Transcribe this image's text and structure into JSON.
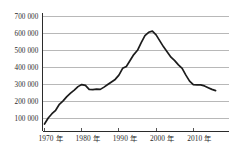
{
  "chart_data": {
    "type": "line",
    "title": "",
    "subtitle": "",
    "xlabel": "",
    "ylabel": "",
    "grid": true,
    "legend": false,
    "legend_position": "none",
    "line_color": "#1c1c1c",
    "grid_color": "#9a9a9a",
    "axis_color": "#2b2b2b",
    "background_color": "#ffffff",
    "xlim": [
      1970,
      2016
    ],
    "ylim": [
      0,
      700000
    ],
    "y_ticks": [
      100000,
      200000,
      300000,
      400000,
      500000,
      600000,
      700000
    ],
    "y_tick_labels": [
      "100 000",
      "200 000",
      "300 000",
      "400 000",
      "500 000",
      "600 000",
      "700 000"
    ],
    "x_ticks": [
      1970,
      1980,
      1990,
      2000,
      2010
    ],
    "x_tick_labels": [
      "1970 年",
      "1980 年",
      "1990 年",
      "2000 年",
      "2010 年"
    ],
    "series": [
      {
        "name": "value",
        "x": [
          1970,
          1971,
          1972,
          1973,
          1974,
          1975,
          1976,
          1977,
          1978,
          1979,
          1980,
          1981,
          1982,
          1983,
          1984,
          1985,
          1986,
          1987,
          1988,
          1989,
          1990,
          1991,
          1992,
          1993,
          1994,
          1995,
          1996,
          1997,
          1998,
          1999,
          2000,
          2001,
          2002,
          2003,
          2004,
          2005,
          2006,
          2007,
          2008,
          2009,
          2010,
          2011,
          2012,
          2013,
          2014,
          2015,
          2016
        ],
        "values": [
          70000,
          105000,
          130000,
          150000,
          185000,
          205000,
          230000,
          250000,
          268000,
          288000,
          300000,
          295000,
          272000,
          270000,
          273000,
          272000,
          285000,
          300000,
          315000,
          330000,
          355000,
          395000,
          405000,
          440000,
          475000,
          500000,
          545000,
          585000,
          605000,
          612000,
          590000,
          555000,
          520000,
          490000,
          460000,
          440000,
          415000,
          395000,
          355000,
          320000,
          300000,
          298000,
          298000,
          292000,
          282000,
          272000,
          265000
        ]
      }
    ]
  }
}
